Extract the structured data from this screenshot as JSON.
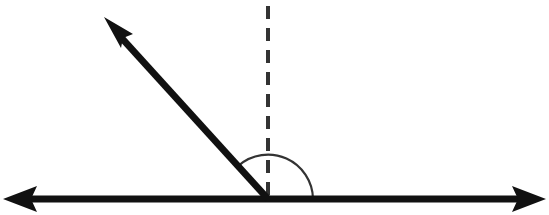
{
  "diagram": {
    "type": "angle-diagram",
    "colors": {
      "line": "#111111",
      "dashed": "#333333",
      "arc": "#333333",
      "background": "#ffffff"
    },
    "vertex": {
      "x": 268,
      "y": 199
    },
    "horizontal_line": {
      "x1": 4,
      "x2": 545,
      "y": 199,
      "arrows": "both"
    },
    "ray": {
      "from": [
        268,
        199
      ],
      "to": [
        104,
        18
      ],
      "arrow": "end"
    },
    "perpendicular": {
      "x": 268,
      "y1": 6,
      "y2": 199,
      "style": "dashed"
    },
    "arc": {
      "radius": 45,
      "from_deg": 0,
      "to_deg": 132
    }
  }
}
